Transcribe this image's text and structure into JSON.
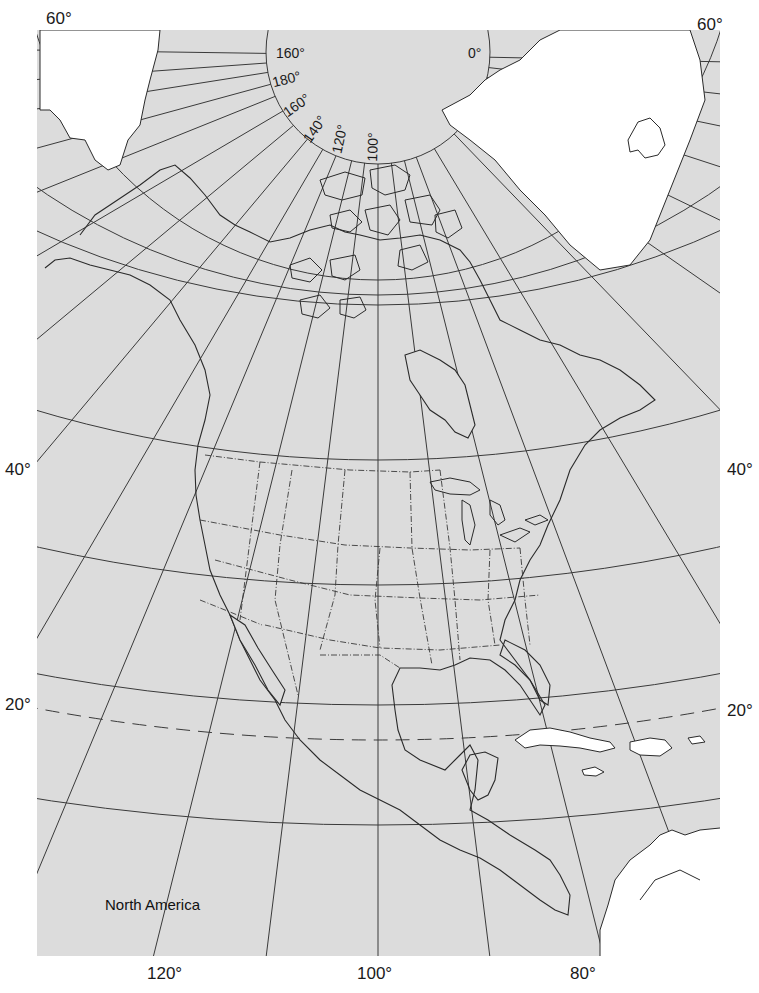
{
  "map": {
    "title": "North America",
    "projection_note": "Polar-centered conic graticule",
    "colors": {
      "ocean": "#dcdcdc",
      "land_highlight": "#ffffff",
      "graticule": "#3a3a3a",
      "coastline": "#2a2a2a",
      "label_text": "#1a1a1a"
    },
    "latitude_labels": {
      "top_left": "60°",
      "top_right": "60°",
      "left_40": "40°",
      "right_40": "40°",
      "left_20": "20°",
      "right_20": "20°"
    },
    "longitude_labels_bottom": [
      "120°",
      "100°",
      "80°"
    ],
    "polar_ring_labels": [
      "160°",
      "180°",
      "160°",
      "140°",
      "120°",
      "100°",
      "0°"
    ],
    "tropic_of_cancer": "dashed line near 23.5°N"
  }
}
